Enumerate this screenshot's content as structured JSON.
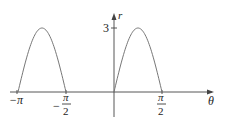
{
  "chart_data": {
    "type": "line",
    "title": "",
    "xlabel": "θ",
    "ylabel": "r",
    "x_ticks": [
      {
        "value": -3.14159,
        "label": "−π"
      },
      {
        "value": -1.5708,
        "label": "−π/2"
      },
      {
        "value": 1.5708,
        "label": "π/2"
      }
    ],
    "y_ticks": [
      {
        "value": 3,
        "label": "3"
      }
    ],
    "series": [
      {
        "name": "r = 3 sin 2θ (r ≥ 0 portions)",
        "x_range": [
          -3.14159,
          -1.5708
        ],
        "peak": {
          "x": -2.356,
          "y": 3
        }
      },
      {
        "name": "r = 3 sin 2θ (r ≥ 0 portions)",
        "x_range": [
          0,
          1.5708
        ],
        "peak": {
          "x": 0.785,
          "y": 3
        }
      }
    ],
    "ylim": [
      0,
      3.5
    ],
    "xlim": [
      -3.4,
      3.1
    ],
    "grid": false,
    "legend": "none"
  },
  "labels": {
    "x_axis": "θ",
    "y_axis": "r",
    "y_tick_3": "3",
    "neg_pi": "−π",
    "neg_half_minus": "−",
    "pi": "π",
    "two": "2"
  }
}
